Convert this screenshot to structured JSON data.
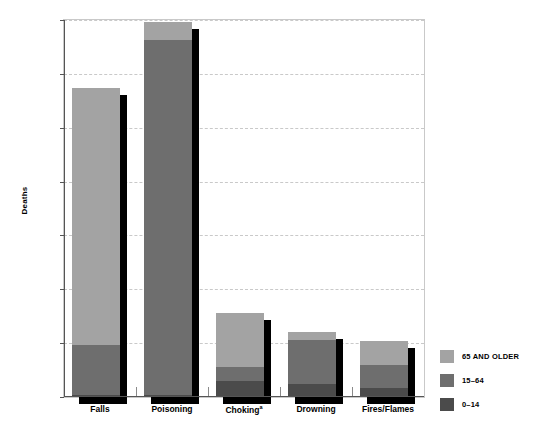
{
  "chart_data": {
    "type": "bar",
    "subtype": "stacked-bar-with-drop-shadow",
    "title": "",
    "xlabel": "",
    "ylabel": "Deaths",
    "ylim": [
      0,
      21000
    ],
    "yticks": [
      0,
      3000,
      6000,
      9000,
      12000,
      15000,
      18000,
      21000
    ],
    "ytick_labels": [
      "0",
      "3,000",
      "6,000",
      "9,000",
      "12,000",
      "15,000",
      "18,000",
      "21,000"
    ],
    "grid": true,
    "grid_style": "dashed",
    "legend_position": "right",
    "categories": [
      "Falls",
      "Poisoning",
      "Chokingᵃ",
      "Drowning",
      "Fires/Flames"
    ],
    "category_labels": [
      "Falls",
      "Poisoning",
      "Choking",
      "Drowning",
      "Fires/Flames"
    ],
    "choking_footnote_marker": "a",
    "series": [
      {
        "name": "0–14",
        "color": "#4b4b4b",
        "values": [
          100,
          140,
          870,
          750,
          480
        ]
      },
      {
        "name": "15–64",
        "color": "#6e6e6e",
        "values": [
          2800,
          19760,
          780,
          2450,
          1320
        ]
      },
      {
        "name": "65 AND OLDER",
        "color": "#a3a3a3",
        "values": [
          14300,
          1000,
          3050,
          400,
          1300
        ]
      }
    ],
    "totals": [
      17200,
      20900,
      4700,
      3600,
      3100
    ],
    "stack_order": [
      "0–14",
      "15–64",
      "65 AND OLDER"
    ]
  },
  "axis": {
    "y_label": "Deaths",
    "y_ticks": [
      {
        "value": 21000,
        "label": "21,000"
      },
      {
        "value": 18000,
        "label": "18,000"
      },
      {
        "value": 15000,
        "label": "15,000"
      },
      {
        "value": 12000,
        "label": "12,000"
      },
      {
        "value": 9000,
        "label": "9,000"
      },
      {
        "value": 6000,
        "label": "6,000"
      },
      {
        "value": 3000,
        "label": "3,000"
      },
      {
        "value": 0,
        "label": "0"
      }
    ]
  },
  "x_categories": [
    {
      "label": "Falls",
      "footnote": ""
    },
    {
      "label": "Poisoning",
      "footnote": ""
    },
    {
      "label": "Choking",
      "footnote": "a"
    },
    {
      "label": "Drowning",
      "footnote": ""
    },
    {
      "label": "Fires/Flames",
      "footnote": ""
    }
  ],
  "legend": {
    "items": [
      {
        "label": "65 AND OLDER",
        "color": "#a3a3a3"
      },
      {
        "label": "15–64",
        "color": "#6e6e6e"
      },
      {
        "label": "0–14",
        "color": "#4b4b4b"
      }
    ]
  },
  "colors": {
    "age_65_plus": "#a3a3a3",
    "age_15_64": "#6e6e6e",
    "age_0_14": "#4b4b4b",
    "shadow": "#000000",
    "gridline": "#c9c9c9",
    "axis": "#555555",
    "background": "#ffffff"
  }
}
